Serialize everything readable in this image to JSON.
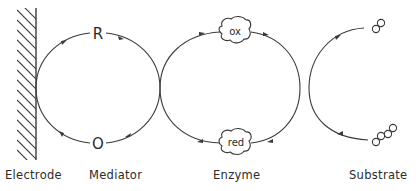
{
  "diagram": {
    "type": "electron-transfer-cycle",
    "stroke_color": "#3a3a3a",
    "labels": {
      "electrode": "Electrode",
      "mediator": "Mediator",
      "enzyme": "Enzyme",
      "substrate": "Substrate"
    },
    "mediator": {
      "reduced": "R",
      "oxidized": "O"
    },
    "enzyme": {
      "oxidized": "ox",
      "reduced": "red"
    },
    "substrate": {
      "product_molecule": "two-ring molecule",
      "substrate_molecule": "four-ring molecule"
    }
  }
}
